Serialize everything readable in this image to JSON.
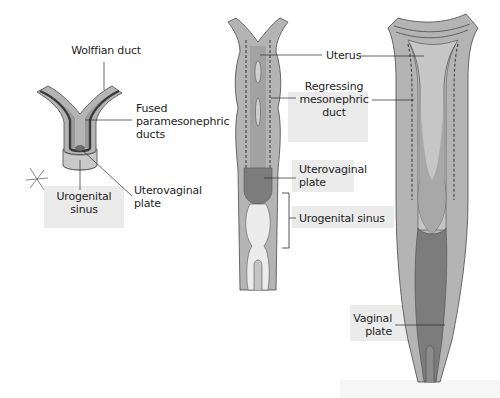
{
  "diagram": {
    "title": "",
    "stages": [
      {
        "id": "stage-1",
        "description": "early fused paramesonephric ducts",
        "labels": {
          "wolffian_duct": "Wolffian duct",
          "fused_line1": "Fused",
          "fused_line2": "paramesonephric",
          "fused_line3": "ducts",
          "urogenital_line1": "Urogenital",
          "urogenital_line2": "sinus",
          "uterovaginal_line1": "Uterovaginal",
          "uterovaginal_line2": "plate"
        }
      },
      {
        "id": "stage-2",
        "description": "developing uterus with uterovaginal plate",
        "labels": {
          "uterus": "Uterus",
          "regressing_line1": "Regressing",
          "regressing_line2": "mesonephric",
          "regressing_line3": "duct",
          "uterovaginal_line1": "Uterovaginal",
          "uterovaginal_line2": "plate",
          "urogenital_sinus": "Urogenital sinus"
        }
      },
      {
        "id": "stage-3",
        "description": "later stage with elongated vaginal plate",
        "labels": {
          "vaginal_line1": "Vaginal",
          "vaginal_line2": "plate"
        }
      }
    ],
    "annotations": {
      "asterisk_mark": "✳"
    },
    "colors": {
      "outer_tissue": "#b4b4b4",
      "duct_fill": "#9a9a9a",
      "dark_plate": "#7c7c7c",
      "wolffian_stroke": "#3a3a3a",
      "sinus_fill": "#e6e6e6",
      "outline": "#4a4a4a",
      "label_bg": "#e4e4e4"
    }
  }
}
